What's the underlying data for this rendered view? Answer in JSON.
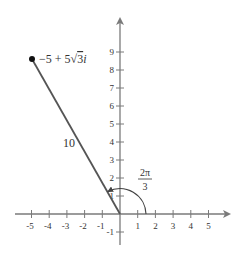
{
  "diagram": {
    "type": "complex-plane-polar-form",
    "axes": {
      "x_ticks": [
        "-5",
        "-4",
        "-3",
        "-2",
        "-1",
        "1",
        "2",
        "3",
        "4",
        "5"
      ],
      "y_ticks": [
        "-1",
        "1",
        "2",
        "3",
        "4",
        "5",
        "6",
        "7",
        "8",
        "9"
      ],
      "x_range": [
        -5,
        5
      ],
      "y_range": [
        -1,
        9
      ],
      "color": "#7a7a7a"
    },
    "point": {
      "label": "−5 + 5√3i",
      "label_parts": {
        "pre": "−5 + 5",
        "radicand": "3",
        "post": "i"
      },
      "x": -5,
      "y": 8.66
    },
    "segment": {
      "length_label": "10",
      "color": "#555555"
    },
    "angle": {
      "numerator": "2π",
      "denominator": "3",
      "degrees": 120
    }
  }
}
